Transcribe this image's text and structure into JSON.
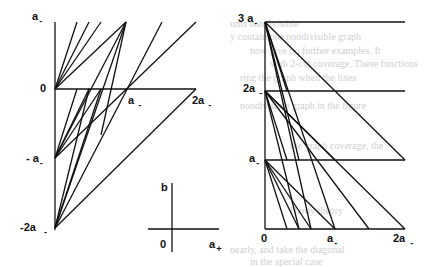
{
  "figure": {
    "left_panel": {
      "y_labels": [
        {
          "text": "a",
          "sub": "-",
          "x": 32,
          "y": 10
        },
        {
          "text": "0",
          "sub": "",
          "x": 40,
          "y": 82
        },
        {
          "text": "- a",
          "sub": "-",
          "x": 26,
          "y": 152
        },
        {
          "text": "-2a",
          "sub": "-",
          "x": 22,
          "y": 221
        }
      ],
      "x_labels": [
        {
          "text": "a",
          "sub": "-",
          "x": 128,
          "y": 94
        },
        {
          "text": "2a",
          "sub": "-",
          "x": 192,
          "y": 94
        }
      ]
    },
    "inset_axes": {
      "y_label": "b",
      "origin_label": "0",
      "x_label": "a",
      "x_label_sub": "+"
    },
    "right_panel": {
      "y_labels": [
        {
          "text": "3 a",
          "sub": "-",
          "x": 238,
          "y": 12
        },
        {
          "text": "2a",
          "sub": "-",
          "x": 243,
          "y": 82
        },
        {
          "text": "a",
          "sub": "-",
          "x": 249,
          "y": 152
        }
      ],
      "x_labels": [
        {
          "text": "0",
          "sub": "",
          "x": 262,
          "y": 231
        },
        {
          "text": "a",
          "sub": "-",
          "x": 326,
          "y": 231
        },
        {
          "text": "2a",
          "sub": "-",
          "x": 393,
          "y": 231
        }
      ]
    }
  },
  "colors": {
    "ink": "#111111",
    "bleed": "#cfcfcf",
    "background": "#ffffff"
  }
}
